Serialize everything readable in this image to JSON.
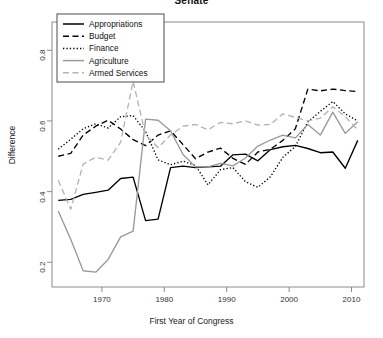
{
  "chart_data": {
    "type": "line",
    "title": "Senate",
    "xlabel": "First Year of Congress",
    "ylabel": "Difference",
    "xlim": [
      1962,
      2012
    ],
    "ylim": [
      0.13,
      0.88
    ],
    "grid": false,
    "legend_position": "top-left",
    "xticks": [
      1970,
      1980,
      1990,
      2000,
      2010
    ],
    "xtick_labels": [
      "1970",
      "1980",
      "1990",
      "2000",
      "2010"
    ],
    "yticks": [
      0.2,
      0.4,
      0.6,
      0.8
    ],
    "ytick_labels": [
      "0.2",
      "0.4",
      "0.6",
      "0.8"
    ],
    "x": [
      1963,
      1965,
      1967,
      1969,
      1971,
      1973,
      1975,
      1977,
      1979,
      1981,
      1983,
      1985,
      1987,
      1989,
      1991,
      1993,
      1995,
      1997,
      1999,
      2001,
      2003,
      2005,
      2007,
      2009,
      2011
    ],
    "series": [
      {
        "name": "Appropriations",
        "color": "#000000",
        "style": "solid",
        "values": [
          0.375,
          0.378,
          0.392,
          0.398,
          0.404,
          0.437,
          0.441,
          0.318,
          0.322,
          0.468,
          0.472,
          0.468,
          0.47,
          0.472,
          0.504,
          0.506,
          0.487,
          0.519,
          0.527,
          0.531,
          0.522,
          0.51,
          0.512,
          0.466,
          0.545
        ]
      },
      {
        "name": "Budget",
        "color": "#000000",
        "style": "dashed",
        "values": [
          0.5,
          0.508,
          0.56,
          0.585,
          0.602,
          0.577,
          0.547,
          0.53,
          0.56,
          0.572,
          0.533,
          0.493,
          0.512,
          0.523,
          0.494,
          0.477,
          0.512,
          0.52,
          0.545,
          0.578,
          0.69,
          0.685,
          0.69,
          0.686,
          0.683
        ]
      },
      {
        "name": "Finance",
        "color": "#000000",
        "style": "dotted",
        "values": [
          0.52,
          0.548,
          0.578,
          0.592,
          0.58,
          0.612,
          0.615,
          0.57,
          0.49,
          0.476,
          0.486,
          0.474,
          0.419,
          0.462,
          0.468,
          0.428,
          0.412,
          0.442,
          0.497,
          0.528,
          0.597,
          0.627,
          0.655,
          0.62,
          0.6
        ]
      },
      {
        "name": "Agriculture",
        "color": "#9a9a9a",
        "style": "solid",
        "values": [
          0.345,
          0.265,
          0.176,
          0.172,
          0.208,
          0.272,
          0.288,
          0.605,
          0.602,
          0.572,
          0.505,
          0.47,
          0.47,
          0.48,
          0.473,
          0.495,
          0.529,
          0.546,
          0.56,
          0.552,
          0.59,
          0.56,
          0.625,
          0.565,
          0.598
        ]
      },
      {
        "name": "Armed Services",
        "color": "#b4b4b4",
        "style": "dashed",
        "values": [
          0.432,
          0.35,
          0.478,
          0.497,
          0.489,
          0.54,
          0.712,
          0.56,
          0.525,
          0.56,
          0.585,
          0.59,
          0.575,
          0.596,
          0.592,
          0.6,
          0.588,
          0.59,
          0.62,
          0.61,
          0.6,
          0.608,
          0.64,
          0.612,
          0.575
        ]
      }
    ],
    "legend_entries": [
      {
        "label": "Appropriations",
        "color": "#000000",
        "style": "solid"
      },
      {
        "label": "Budget",
        "color": "#000000",
        "style": "dashed"
      },
      {
        "label": "Finance",
        "color": "#000000",
        "style": "dotted"
      },
      {
        "label": "Agriculture",
        "color": "#9a9a9a",
        "style": "solid"
      },
      {
        "label": "Armed Services",
        "color": "#b4b4b4",
        "style": "dashed"
      }
    ]
  }
}
